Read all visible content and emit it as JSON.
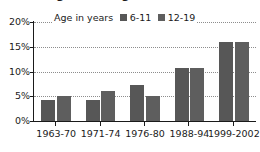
{
  "chart_data": {
    "type": "bar",
    "title": "Overweight among children, 1963–2002",
    "subtitle": "",
    "xlabel": "",
    "ylabel": "",
    "categories": [
      "1963-70",
      "1971-74",
      "1976-80",
      "1988-94",
      "1999-2002"
    ],
    "series": [
      {
        "name": "6-11",
        "values": [
          4.2,
          4.3,
          7.2,
          10.8,
          16.0
        ],
        "color": "#575757"
      },
      {
        "name": "12-19",
        "values": [
          5.0,
          6.0,
          5.1,
          10.8,
          16.0
        ],
        "color": "#5e5e5e"
      }
    ],
    "legend_caption": "Age in years",
    "legend_position": "top-center",
    "ylim": [
      0,
      20
    ],
    "yticks": [
      0,
      5,
      10,
      15,
      20
    ],
    "ytick_labels": [
      "0%",
      "5%",
      "10%",
      "15%",
      "20%"
    ],
    "grid": true,
    "grid_style": "dotted",
    "units": "percent"
  },
  "colors": {
    "series_1": "#575757",
    "series_2": "#5e5e5e",
    "axis": "#1a1a1a",
    "gridline": "#8d8d8d",
    "background": "#ffffff"
  }
}
